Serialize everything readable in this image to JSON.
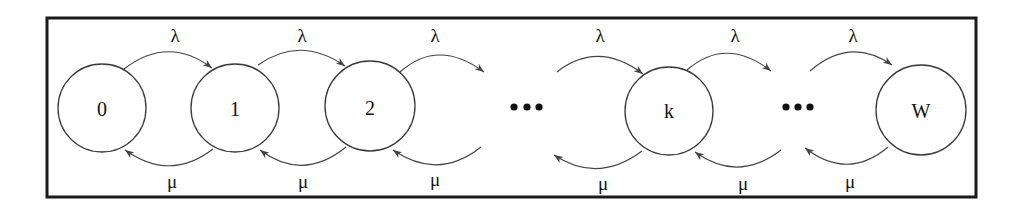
{
  "diagram": {
    "type": "birth-death Markov chain",
    "colors": {
      "frame": "#1a1a1a",
      "stroke": "#444444",
      "text": "#111111",
      "background": "#ffffff"
    },
    "states": [
      {
        "id": "s0",
        "label": "0",
        "cx": 102,
        "cy": 108,
        "r": 44
      },
      {
        "id": "s1",
        "label": "1",
        "cx": 235,
        "cy": 108,
        "r": 44
      },
      {
        "id": "s2",
        "label": "2",
        "cx": 370,
        "cy": 106,
        "r": 45
      },
      {
        "id": "sk",
        "label": "k",
        "cx": 669,
        "cy": 111,
        "r": 44
      },
      {
        "id": "sW",
        "label": "W",
        "cx": 921,
        "cy": 110,
        "r": 45
      }
    ],
    "ellipses": [
      {
        "label": "•••",
        "dots_x": [
          514,
          527,
          539
        ],
        "y": 107
      },
      {
        "label": "•••",
        "dots_x": [
          786,
          798,
          810
        ],
        "y": 107
      }
    ],
    "arrival_rate_symbol": "λ",
    "service_rate_symbol": "μ",
    "forward_transitions": [
      {
        "from": "0",
        "to": "1",
        "label": "λ",
        "lx": 175,
        "ly": 35
      },
      {
        "from": "1",
        "to": "2",
        "label": "λ",
        "lx": 302,
        "ly": 35
      },
      {
        "from": "2",
        "to": "…",
        "label": "λ",
        "lx": 435,
        "ly": 35
      },
      {
        "from": "…",
        "to": "k",
        "label": "λ",
        "lx": 600,
        "ly": 35
      },
      {
        "from": "k",
        "to": "…",
        "label": "λ",
        "lx": 735,
        "ly": 35
      },
      {
        "from": "…",
        "to": "W",
        "label": "λ",
        "lx": 853,
        "ly": 35
      }
    ],
    "backward_transitions": [
      {
        "from": "1",
        "to": "0",
        "label": "μ",
        "lx": 172,
        "ly": 181
      },
      {
        "from": "2",
        "to": "1",
        "label": "μ",
        "lx": 303,
        "ly": 181
      },
      {
        "from": "…",
        "to": "2",
        "label": "μ",
        "lx": 435,
        "ly": 179
      },
      {
        "from": "k",
        "to": "…",
        "label": "μ",
        "lx": 603,
        "ly": 183
      },
      {
        "from": "…",
        "to": "k",
        "label": "μ",
        "lx": 743,
        "ly": 183
      },
      {
        "from": "W",
        "to": "…",
        "label": "μ",
        "lx": 850,
        "ly": 181
      }
    ]
  }
}
